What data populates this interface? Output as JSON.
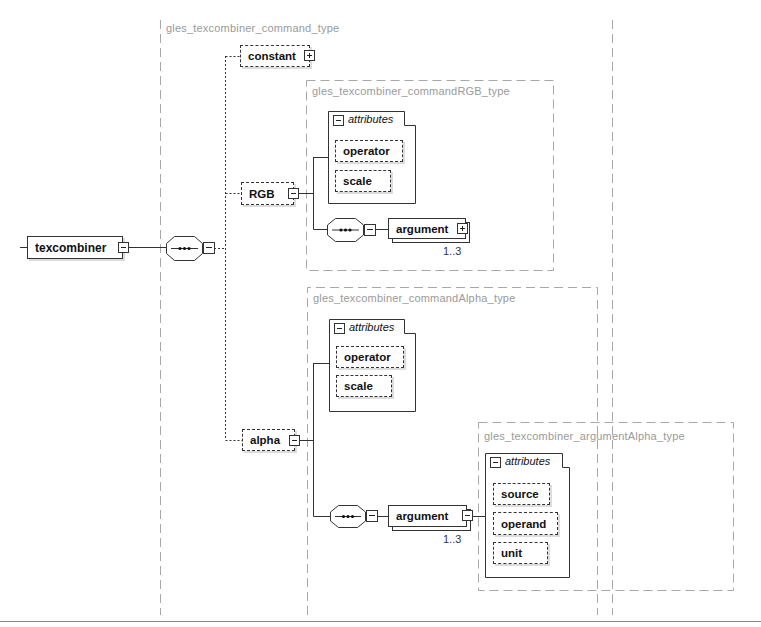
{
  "root": {
    "name": "texcombiner"
  },
  "types": {
    "command": {
      "label": "gles_texcombiner_command_type"
    },
    "commandRGB": {
      "label": "gles_texcombiner_commandRGB_type"
    },
    "commandAlpha": {
      "label": "gles_texcombiner_commandAlpha_type"
    },
    "argumentAlpha": {
      "label": "gles_texcombiner_argumentAlpha_type"
    }
  },
  "elements": {
    "constant": {
      "name": "constant",
      "toggle": "plus-icon"
    },
    "rgb": {
      "name": "RGB",
      "toggle": "minus-icon"
    },
    "alpha": {
      "name": "alpha",
      "toggle": "minus-icon"
    },
    "rgb_argument": {
      "name": "argument",
      "occurs": "1..3",
      "toggle": "plus-icon"
    },
    "alpha_argument": {
      "name": "argument",
      "occurs": "1..3",
      "toggle": "minus-icon"
    }
  },
  "compositors": {
    "root_sequence": {
      "icon": "sequence-icon"
    },
    "rgb_sequence": {
      "icon": "sequence-icon"
    },
    "alpha_sequence": {
      "icon": "sequence-icon"
    }
  },
  "attribute_groups": {
    "rgb": {
      "title": "attributes",
      "items": [
        "operator",
        "scale"
      ]
    },
    "alpha": {
      "title": "attributes",
      "items": [
        "operator",
        "scale"
      ]
    },
    "argument_alpha": {
      "title": "attributes",
      "items": [
        "source",
        "operand",
        "unit"
      ]
    }
  },
  "colors": {
    "line": "#333333",
    "type_border": "#a8a8a8",
    "type_label": "#9a9a9a",
    "shadow": "#dcdcdc"
  }
}
